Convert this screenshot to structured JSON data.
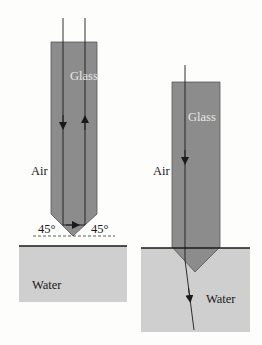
{
  "colors": {
    "background": "#fdfdfc",
    "glass": "#8c8c8c",
    "glass_edge": "#555555",
    "water": "#cfcfcf",
    "line": "#1a1a1a",
    "glass_label": "#e8e8e8"
  },
  "left_panel": {
    "glass_label": "Glass",
    "air_label": "Air",
    "water_label": "Water",
    "angle_left": "45°",
    "angle_right": "45°"
  },
  "right_panel": {
    "glass_label": "Glass",
    "air_label": "Air",
    "water_label": "Water"
  }
}
